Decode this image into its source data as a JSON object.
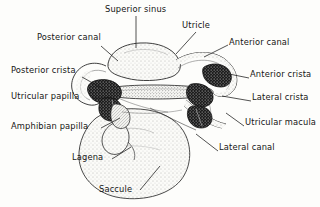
{
  "figure": {
    "type": "anatomical-line-diagram",
    "background_color": "#fdfdfb",
    "ink_color": "#151515",
    "style": "stippled pen-and-ink drawing with leader lines to text labels"
  },
  "labels": [
    {
      "id": "superior-sinus",
      "text": "Superior sinus",
      "x": 105,
      "y": 5,
      "align": "left"
    },
    {
      "id": "utricle",
      "text": "Utricle",
      "x": 182,
      "y": 21,
      "align": "left"
    },
    {
      "id": "posterior-canal",
      "text": "Posterior canal",
      "x": 37,
      "y": 33,
      "align": "left"
    },
    {
      "id": "anterior-canal",
      "text": "Anterior canal",
      "x": 229,
      "y": 38,
      "align": "left"
    },
    {
      "id": "posterior-crista",
      "text": "Posterior crista",
      "x": 11,
      "y": 66,
      "align": "left"
    },
    {
      "id": "anterior-crista",
      "text": "Anterior crista",
      "x": 250,
      "y": 70,
      "align": "left"
    },
    {
      "id": "utricular-papilla",
      "text": "Utricular papilla",
      "x": 11,
      "y": 92,
      "align": "left"
    },
    {
      "id": "lateral-crista",
      "text": "Lateral crista",
      "x": 252,
      "y": 93,
      "align": "left"
    },
    {
      "id": "amphibian-papilla",
      "text": "Amphibian papilla",
      "x": 11,
      "y": 122,
      "align": "left"
    },
    {
      "id": "utricular-macula",
      "text": "Utricular macula",
      "x": 245,
      "y": 118,
      "align": "left"
    },
    {
      "id": "lagena",
      "text": "Lagena",
      "x": 72,
      "y": 153,
      "align": "left"
    },
    {
      "id": "lateral-canal",
      "text": "Lateral canal",
      "x": 219,
      "y": 143,
      "align": "left"
    },
    {
      "id": "saccule",
      "text": "Saccule",
      "x": 99,
      "y": 185,
      "align": "left"
    }
  ],
  "leaders": [
    {
      "id": "leader-superior-sinus",
      "points": "136,16 136,48"
    },
    {
      "id": "leader-utricle",
      "points": "196,32 176,54"
    },
    {
      "id": "leader-posterior-canal",
      "points": "101,46 118,61"
    },
    {
      "id": "leader-anterior-canal",
      "points": "228,45 204,57"
    },
    {
      "id": "leader-posterior-crista",
      "points": "82,77 105,90"
    },
    {
      "id": "leader-anterior-crista",
      "points": "249,78 229,74"
    },
    {
      "id": "leader-utricular-papilla",
      "points": "92,98 112,98"
    },
    {
      "id": "leader-lateral-crista",
      "points": "251,101 222,96"
    },
    {
      "id": "leader-amphibian-papilla",
      "points": "101,128 120,118"
    },
    {
      "id": "leader-utricular-macula",
      "points": "244,126 226,113"
    },
    {
      "id": "leader-lagena",
      "points": "112,159 131,147"
    },
    {
      "id": "leader-lateral-canal",
      "points": "218,151 196,134"
    },
    {
      "id": "leader-saccule",
      "points": "140,190 160,166"
    }
  ],
  "structures": [
    {
      "id": "posterior-canal-arc",
      "name": "posterior semicircular canal"
    },
    {
      "id": "anterior-canal-arc",
      "name": "anterior semicircular canal"
    },
    {
      "id": "lateral-canal-arc",
      "name": "lateral semicircular canal"
    },
    {
      "id": "superior-sinus-body",
      "name": "superior sinus"
    },
    {
      "id": "utricle-body",
      "name": "utricle"
    },
    {
      "id": "saccule-body",
      "name": "saccule"
    },
    {
      "id": "lagena-lobe",
      "name": "lagena"
    },
    {
      "id": "posterior-crista-mass",
      "name": "posterior crista (dark stippled mass)"
    },
    {
      "id": "anterior-crista-mass",
      "name": "anterior crista (dark stippled mass)"
    },
    {
      "id": "lateral-crista-mass",
      "name": "lateral crista (dark stippled mass)"
    },
    {
      "id": "utricular-macula-mass",
      "name": "utricular macula"
    },
    {
      "id": "utricular-papilla-mass",
      "name": "utricular papilla"
    },
    {
      "id": "amphibian-papilla-mass",
      "name": "amphibian papilla"
    }
  ]
}
